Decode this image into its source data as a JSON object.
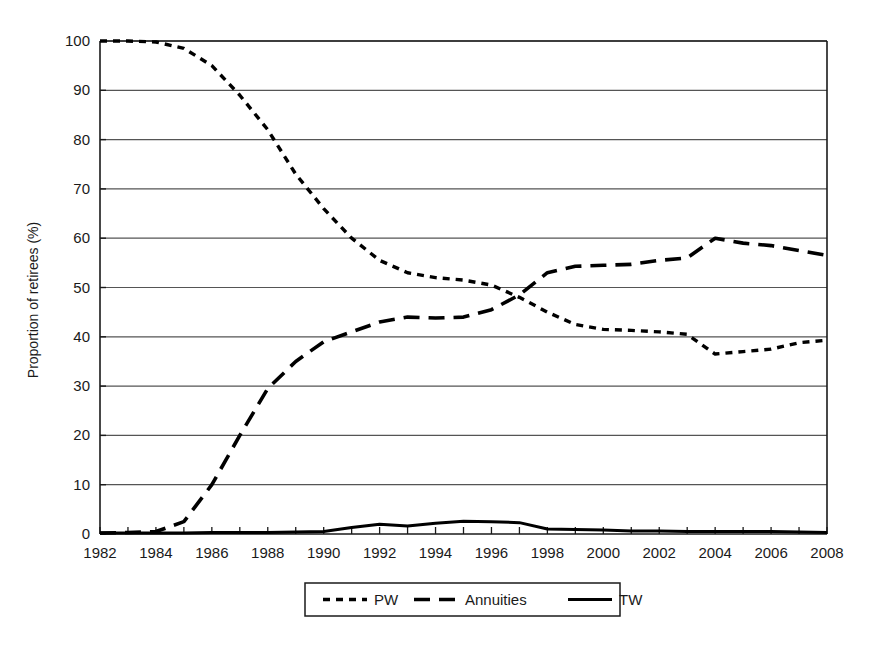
{
  "chart_data": {
    "type": "line",
    "title": "",
    "subtitle": "",
    "xlabel": "",
    "ylabel": "Proportion of retirees (%)",
    "xlim": [
      1982,
      2008
    ],
    "ylim": [
      0,
      100
    ],
    "grid": "horizontal",
    "legend_position": "below-plot",
    "x_tick_labels": [
      "1982",
      "1984",
      "1986",
      "1988",
      "1990",
      "1992",
      "1994",
      "1996",
      "1998",
      "2000",
      "2002",
      "2004",
      "2006",
      "2008"
    ],
    "x_tick_values": [
      1982,
      1984,
      1986,
      1988,
      1990,
      1992,
      1994,
      1996,
      1998,
      2000,
      2002,
      2004,
      2006,
      2008
    ],
    "x_minor_tick_values": [
      1983,
      1985,
      1987,
      1989,
      1991,
      1993,
      1995,
      1997,
      1999,
      2001,
      2003,
      2005,
      2007
    ],
    "y_tick_labels": [
      "0",
      "10",
      "20",
      "30",
      "40",
      "50",
      "60",
      "70",
      "80",
      "90",
      "100"
    ],
    "y_tick_values": [
      0,
      10,
      20,
      30,
      40,
      50,
      60,
      70,
      80,
      90,
      100
    ],
    "x": [
      1982,
      1983,
      1984,
      1985,
      1986,
      1987,
      1988,
      1989,
      1990,
      1991,
      1992,
      1993,
      1994,
      1995,
      1996,
      1997,
      1998,
      1999,
      2000,
      2001,
      2002,
      2003,
      2004,
      2005,
      2006,
      2007,
      2008
    ],
    "series": [
      {
        "name": "PW",
        "dash": "short-dash",
        "color": "#000000",
        "values": [
          100,
          100,
          99.8,
          98.5,
          95,
          89,
          82,
          73,
          66,
          60,
          55.5,
          53,
          52,
          51.5,
          50.5,
          48,
          45,
          42.5,
          41.5,
          41.3,
          41,
          40.5,
          36.5,
          37,
          37.5,
          38.8,
          39.3
        ]
      },
      {
        "name": "Annuities",
        "dash": "long-dash",
        "color": "#000000",
        "values": [
          0.2,
          0.3,
          0.5,
          2.5,
          10,
          20,
          29.5,
          35,
          39,
          41,
          43,
          44,
          43.8,
          44,
          45.5,
          48.5,
          53,
          54.3,
          54.5,
          54.7,
          55.5,
          56,
          60,
          59,
          58.5,
          57.5,
          56.5
        ]
      },
      {
        "name": "TW",
        "dash": "solid",
        "color": "#000000",
        "values": [
          0.2,
          0.2,
          0.2,
          0.2,
          0.3,
          0.3,
          0.3,
          0.4,
          0.5,
          1.3,
          2,
          1.6,
          2.2,
          2.6,
          2.5,
          2.3,
          1,
          0.9,
          0.8,
          0.6,
          0.6,
          0.5,
          0.5,
          0.5,
          0.5,
          0.4,
          0.3
        ]
      }
    ],
    "legend_entries": [
      {
        "label": "PW",
        "dash": "short-dash"
      },
      {
        "label": "Annuities",
        "dash": "long-dash"
      },
      {
        "label": "TW",
        "dash": "solid"
      }
    ]
  },
  "colors": {
    "axis": "#1a1a1a",
    "grid": "#555555",
    "line": "#000000",
    "background": "#ffffff"
  }
}
